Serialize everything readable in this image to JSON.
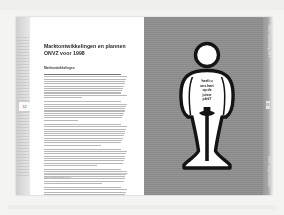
{
  "document": {
    "type": "scanned-annual-report-spread",
    "left_page": {
      "title": "Marktontwikkelingen en plannen ONVZ voor 1998",
      "subtitle": "Marktontwikkelingen",
      "page_number": "12",
      "footer_text": "ONVZ Jaarverslag 1997",
      "paragraphs": [
        {
          "lines": 11,
          "emphasis_lines": [
            0
          ]
        },
        {
          "lines": 9,
          "emphasis_lines": []
        },
        {
          "lines": 10,
          "emphasis_lines": []
        },
        {
          "lines": 8,
          "emphasis_lines": []
        },
        {
          "lines": 7,
          "emphasis_lines": []
        },
        {
          "lines": 9,
          "emphasis_lines": []
        }
      ]
    },
    "right_page": {
      "page_number": "13",
      "background_color": "#8f8f8f",
      "poster": {
        "lines": [
          "heeft u",
          "ons hart",
          "op de",
          "juiste",
          "plek?"
        ],
        "figure_name": "bowling-pin-person-silhouette",
        "figure_color": "#ffffff",
        "outline_color": "#141414"
      },
      "side_text_top": "ONVZ Jaarverslag 1997",
      "side_text_bottom": "ONVZ Zorgverzekeraar"
    }
  }
}
